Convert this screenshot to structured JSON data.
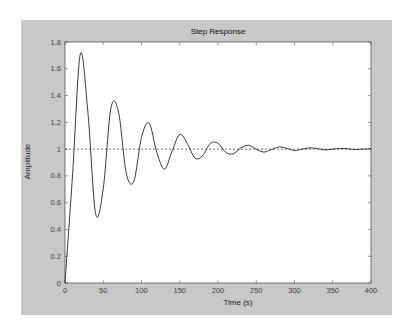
{
  "chart_data": {
    "type": "line",
    "title": "Step Response",
    "xlabel": "Time (s)",
    "ylabel": "Amplitude",
    "xlim": [
      0,
      400
    ],
    "ylim": [
      0,
      1.8
    ],
    "xticks": [
      0,
      50,
      100,
      150,
      200,
      250,
      300,
      350,
      400
    ],
    "yticks": [
      0,
      0.2,
      0.4,
      0.6,
      0.8,
      1,
      1.2,
      1.4,
      1.6,
      1.8
    ],
    "grid": false,
    "legend": null,
    "reference_line": {
      "y": 1,
      "style": "dashed"
    },
    "series": [
      {
        "name": "Step Response",
        "x": [
          0,
          10,
          20,
          30,
          40,
          50,
          60,
          70,
          80,
          90,
          100,
          110,
          120,
          130,
          140,
          150,
          160,
          170,
          180,
          190,
          200,
          210,
          220,
          230,
          240,
          250,
          260,
          270,
          280,
          290,
          300,
          310,
          320,
          330,
          340,
          350,
          360,
          370,
          380,
          390,
          400
        ],
        "values": [
          0,
          0.819,
          1.711,
          1.27,
          0.519,
          0.707,
          1.306,
          1.276,
          0.823,
          0.761,
          1.088,
          1.194,
          0.975,
          0.85,
          0.985,
          1.11,
          1.04,
          0.932,
          0.952,
          1.043,
          1.043,
          0.976,
          0.965,
          1.009,
          1.029,
          0.999,
          0.978,
          0.997,
          1.016,
          1.006,
          0.989,
          1.0,
          1.009,
          1.004,
          0.994,
          1.0,
          1.005,
          1.002,
          0.997,
          1.0,
          1.003
        ]
      }
    ],
    "annotations": {
      "peaks": [
        {
          "t": 20,
          "A": 1.7
        },
        {
          "t": 63,
          "A": 1.37
        },
        {
          "t": 107,
          "A": 1.19
        },
        {
          "t": 150,
          "A": 1.1
        }
      ],
      "troughs": [
        {
          "t": 41,
          "A": 0.49
        },
        {
          "t": 85,
          "A": 0.74
        },
        {
          "t": 128,
          "A": 0.85
        }
      ]
    }
  },
  "colors": {
    "figure_bg": "#c8c8c8",
    "axes_bg": "#ffffff",
    "line": "#222222"
  }
}
